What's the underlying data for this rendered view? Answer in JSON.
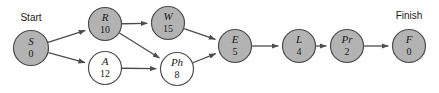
{
  "diagram": {
    "type": "activity-on-node-network",
    "title": "",
    "canvas": {
      "width": 439,
      "height": 93,
      "background": "#ffffff"
    },
    "colors": {
      "node_filled": "#b3b3b3",
      "node_open": "#ffffff",
      "node_stroke": "#4c4c4c",
      "edge": "#4c4c4c",
      "text": "#1a1a1a"
    },
    "endpoint_labels": {
      "start": "Start",
      "finish": "Finish"
    },
    "nodes": [
      {
        "id": "S",
        "letter": "S",
        "value": "0",
        "cx": 31,
        "cy": 48,
        "r": 17.5,
        "fill": "filled"
      },
      {
        "id": "R",
        "letter": "R",
        "value": "10",
        "cx": 105,
        "cy": 24,
        "r": 16.5,
        "fill": "filled"
      },
      {
        "id": "W",
        "letter": "W",
        "value": "15",
        "cx": 168,
        "cy": 23,
        "r": 16.5,
        "fill": "filled"
      },
      {
        "id": "A",
        "letter": "A",
        "value": "12",
        "cx": 105,
        "cy": 68,
        "r": 16.5,
        "fill": "open"
      },
      {
        "id": "Ph",
        "letter": "Ph",
        "value": "8",
        "cx": 177,
        "cy": 69,
        "r": 16.5,
        "fill": "open"
      },
      {
        "id": "E",
        "letter": "E",
        "value": "5",
        "cx": 235,
        "cy": 46,
        "r": 16.5,
        "fill": "filled"
      },
      {
        "id": "L",
        "letter": "L",
        "value": "4",
        "cx": 299,
        "cy": 46,
        "r": 16.5,
        "fill": "filled"
      },
      {
        "id": "Pr",
        "letter": "Pr",
        "value": "2",
        "cx": 347,
        "cy": 46,
        "r": 16.5,
        "fill": "filled"
      },
      {
        "id": "F",
        "letter": "F",
        "value": "0",
        "cx": 409,
        "cy": 46,
        "r": 16.5,
        "fill": "filled"
      }
    ],
    "edges": [
      {
        "from": "S",
        "to": "R"
      },
      {
        "from": "S",
        "to": "A"
      },
      {
        "from": "R",
        "to": "W"
      },
      {
        "from": "R",
        "to": "Ph"
      },
      {
        "from": "A",
        "to": "Ph"
      },
      {
        "from": "W",
        "to": "E"
      },
      {
        "from": "Ph",
        "to": "E"
      },
      {
        "from": "E",
        "to": "L"
      },
      {
        "from": "L",
        "to": "Pr"
      },
      {
        "from": "Pr",
        "to": "F"
      }
    ]
  }
}
